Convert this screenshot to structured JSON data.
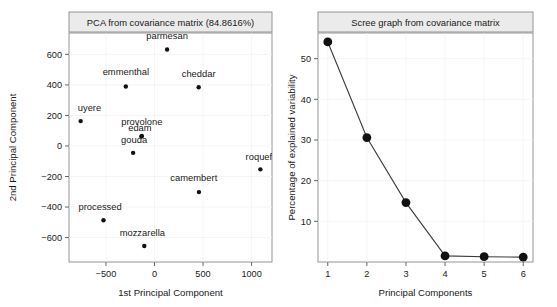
{
  "chart_data": [
    {
      "id": "pca",
      "type": "scatter",
      "title": "PCA from covariance matrix (84.8616%)",
      "xlabel": "1st Principal Component",
      "ylabel": "2nd Principal Component",
      "xticks": [
        -500,
        0,
        500,
        1000
      ],
      "yticks": [
        600,
        400,
        200,
        0,
        -200,
        -400,
        -600
      ],
      "xlim": [
        -880,
        1210
      ],
      "ylim": [
        -760,
        740
      ],
      "grid": true,
      "legend": "none",
      "points": [
        {
          "label": "parmesan",
          "x": 130,
          "y": 632,
          "lx": 130,
          "ly": 700,
          "anchor": "middle"
        },
        {
          "label": "emmenthal",
          "x": -295,
          "y": 390,
          "lx": -295,
          "ly": 462,
          "anchor": "middle"
        },
        {
          "label": "cheddar",
          "x": 455,
          "y": 385,
          "lx": 455,
          "ly": 455,
          "anchor": "middle"
        },
        {
          "label": "uyere",
          "x": -760,
          "y": 163,
          "lx": -790,
          "ly": 228,
          "anchor": "start"
        },
        {
          "label": "provolone",
          "x": -130,
          "y": 65,
          "lx": -130,
          "ly": 137,
          "anchor": "middle"
        },
        {
          "label": "edam",
          "x": -135,
          "y": 62,
          "lx": -150,
          "ly": 100,
          "anchor": "middle"
        },
        {
          "label": "gouda",
          "x": -220,
          "y": -45,
          "lx": -210,
          "ly": 20,
          "anchor": "middle"
        },
        {
          "label": "roquef",
          "x": 1090,
          "y": -153,
          "lx": 1075,
          "ly": -90,
          "anchor": "middle"
        },
        {
          "label": "camembert",
          "x": 458,
          "y": -302,
          "lx": 405,
          "ly": -232,
          "anchor": "middle"
        },
        {
          "label": "processed",
          "x": -525,
          "y": -487,
          "lx": -560,
          "ly": -420,
          "anchor": "middle"
        },
        {
          "label": "mozzarella",
          "x": -105,
          "y": -655,
          "lx": -125,
          "ly": -588,
          "anchor": "middle"
        }
      ]
    },
    {
      "id": "scree",
      "type": "line",
      "title": "Scree graph from covariance matrix",
      "xlabel": "Principal Components",
      "ylabel": "Percentage of explained variability",
      "categories": [
        1,
        2,
        3,
        4,
        5,
        6
      ],
      "values": [
        54.1,
        30.6,
        14.6,
        1.5,
        1.3,
        1.2
      ],
      "xticks": [
        1,
        2,
        3,
        4,
        5,
        6
      ],
      "yticks": [
        10,
        20,
        30,
        40,
        50
      ],
      "xlim": [
        0.75,
        6.25
      ],
      "ylim": [
        0.0,
        56.3
      ],
      "grid": true,
      "legend": "none"
    }
  ]
}
